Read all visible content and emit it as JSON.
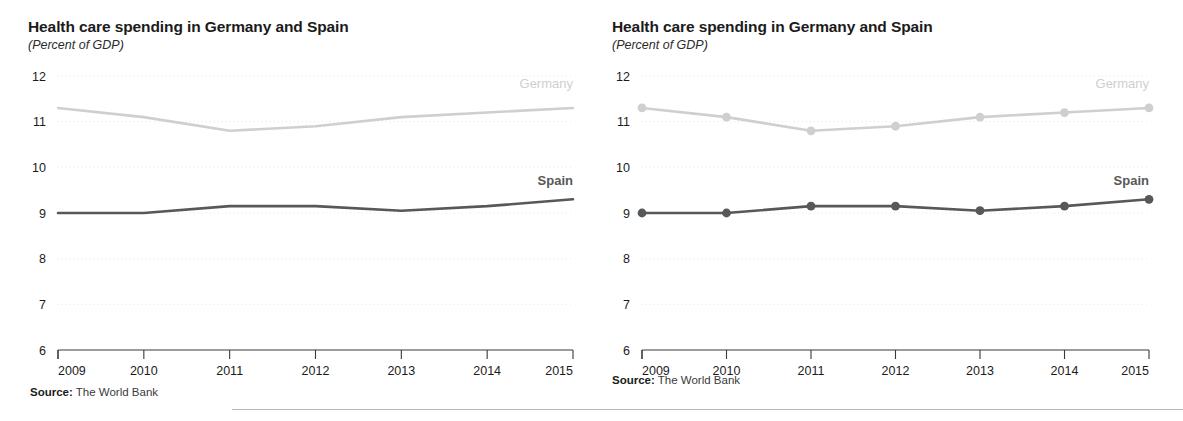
{
  "figure": {
    "bottom_rule": true
  },
  "panels": [
    {
      "id": "left",
      "title": "Health care spending in Germany and Spain",
      "subtitle": "(Percent of GDP)",
      "source_prefix": "Source:",
      "source_text": " The World Bank",
      "markers": false,
      "series_labels": {
        "germany": "Germany",
        "spain": "Spain"
      }
    },
    {
      "id": "right",
      "title": "Health care spending in Germany and Spain",
      "subtitle": "(Percent of GDP)",
      "source_prefix": "Source:",
      "source_text": " The World Bank",
      "markers": true,
      "series_labels": {
        "germany": "Germany",
        "spain": "Spain"
      }
    }
  ],
  "colors": {
    "germany": "#cfcfcf",
    "spain": "#585858",
    "grid": "#e6e6e6",
    "axis": "#3a3a3a",
    "text": "#1b1b1b"
  },
  "chart_data": [
    {
      "type": "line",
      "title": "Health care spending in Germany and Spain",
      "subtitle": "(Percent of GDP)",
      "xlabel": "",
      "ylabel": "Percent of GDP",
      "x": [
        2009,
        2010,
        2011,
        2012,
        2013,
        2014,
        2015
      ],
      "xticklabels": [
        "2009",
        "2010",
        "2011",
        "2012",
        "2013",
        "2014",
        "2015"
      ],
      "yticklabels": [
        "6",
        "7",
        "8",
        "9",
        "10",
        "11",
        "12"
      ],
      "ylim": [
        6,
        12
      ],
      "xlim": [
        2009,
        2015
      ],
      "grid": true,
      "markers": false,
      "legend": "inline-right-of-line",
      "series": [
        {
          "name": "Germany",
          "values": [
            11.3,
            11.1,
            10.8,
            10.9,
            11.1,
            11.2,
            11.3
          ],
          "color": "#cfcfcf"
        },
        {
          "name": "Spain",
          "values": [
            9.0,
            9.0,
            9.15,
            9.15,
            9.05,
            9.15,
            9.3
          ],
          "color": "#585858"
        }
      ],
      "source": "Source: The World Bank"
    },
    {
      "type": "line",
      "title": "Health care spending in Germany and Spain",
      "subtitle": "(Percent of GDP)",
      "xlabel": "",
      "ylabel": "Percent of GDP",
      "x": [
        2009,
        2010,
        2011,
        2012,
        2013,
        2014,
        2015
      ],
      "xticklabels": [
        "2009",
        "2010",
        "2011",
        "2012",
        "2013",
        "2014",
        "2015"
      ],
      "yticklabels": [
        "6",
        "7",
        "8",
        "9",
        "10",
        "11",
        "12"
      ],
      "ylim": [
        6,
        12
      ],
      "xlim": [
        2009,
        2015
      ],
      "grid": true,
      "markers": true,
      "legend": "inline-right-of-line",
      "series": [
        {
          "name": "Germany",
          "values": [
            11.3,
            11.1,
            10.8,
            10.9,
            11.1,
            11.2,
            11.3
          ],
          "color": "#cfcfcf"
        },
        {
          "name": "Spain",
          "values": [
            9.0,
            9.0,
            9.15,
            9.15,
            9.05,
            9.15,
            9.3
          ],
          "color": "#585858"
        }
      ],
      "source": "Source: The World Bank"
    }
  ]
}
